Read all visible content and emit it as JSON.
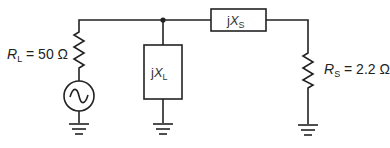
{
  "diagram": {
    "type": "circuit-schematic",
    "components": {
      "load_resistor": {
        "symbol": "R",
        "subscript": "L",
        "equals": " = ",
        "value": "50 Ω"
      },
      "source": {
        "symbol": "ac-voltage-source"
      },
      "shunt_reactance": {
        "prefix": "j",
        "symbol": "X",
        "subscript": "L"
      },
      "series_reactance": {
        "prefix": "j",
        "symbol": "X",
        "subscript": "S"
      },
      "source_resistor": {
        "symbol": "R",
        "subscript": "S",
        "equals": " = ",
        "value": "2.2 Ω"
      }
    },
    "grounds": 3,
    "junctions": 1,
    "colors": {
      "line": "#222222",
      "background": "#ffffff"
    }
  }
}
